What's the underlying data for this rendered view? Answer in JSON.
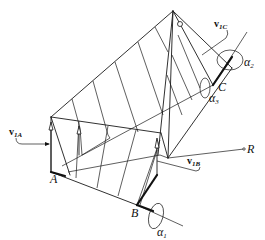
{
  "figure": {
    "type": "geometric-diagram",
    "points": {
      "A": "A",
      "B": "B",
      "C": "C",
      "R": "R"
    },
    "vectors": {
      "v1A": {
        "base": "v",
        "sub": "1A"
      },
      "v1B": {
        "base": "v",
        "sub": "1B"
      },
      "v1C": {
        "base": "v",
        "sub": "1C"
      }
    },
    "angles": {
      "alpha1": {
        "base": "α",
        "sub": "1"
      },
      "alpha2": {
        "base": "α",
        "sub": "2"
      },
      "alpha3": {
        "base": "α",
        "sub": "3"
      }
    },
    "line_color": "#1a1a1a",
    "background": "#ffffff"
  }
}
